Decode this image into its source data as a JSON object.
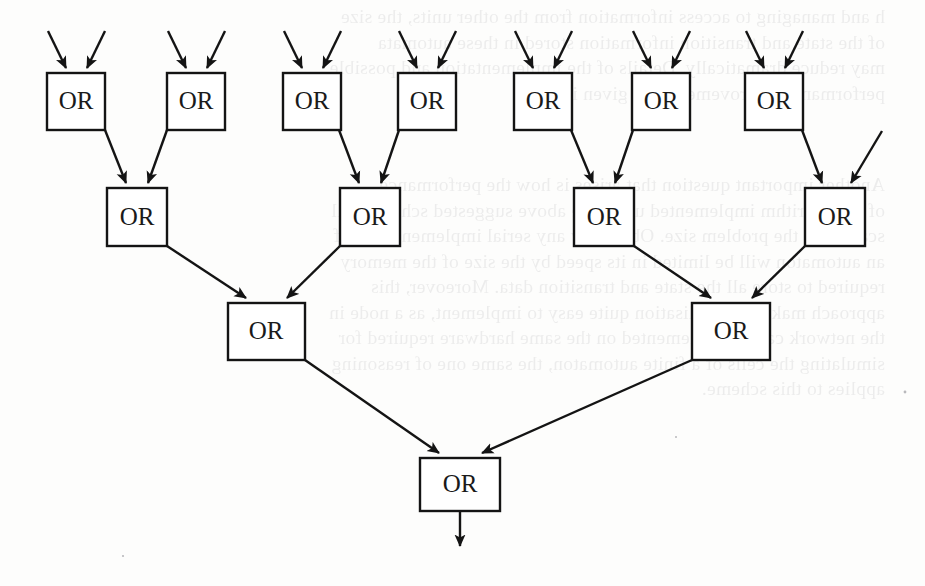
{
  "page": {
    "width": 925,
    "height": 586,
    "background_color": "#fdfdfc",
    "ink_color": "#141414",
    "kind": "scanned-book-figure"
  },
  "figure": {
    "gate_label": "OR",
    "levels": 4,
    "total_gates": 14,
    "output_arrow": true
  },
  "gates": {
    "row1": [
      {
        "id": "or-1-1",
        "label": "OR",
        "x": 47,
        "y": 73,
        "w": 58,
        "h": 57,
        "inputs": 2
      },
      {
        "id": "or-1-2",
        "label": "OR",
        "x": 167,
        "y": 73,
        "w": 58,
        "h": 57,
        "inputs": 2
      },
      {
        "id": "or-1-3",
        "label": "OR",
        "x": 283,
        "y": 73,
        "w": 58,
        "h": 57,
        "inputs": 2
      },
      {
        "id": "or-1-4",
        "label": "OR",
        "x": 398,
        "y": 73,
        "w": 58,
        "h": 57,
        "inputs": 2
      },
      {
        "id": "or-1-5",
        "label": "OR",
        "x": 514,
        "y": 73,
        "w": 58,
        "h": 57,
        "inputs": 2
      },
      {
        "id": "or-1-6",
        "label": "OR",
        "x": 632,
        "y": 73,
        "w": 58,
        "h": 57,
        "inputs": 2
      },
      {
        "id": "or-1-7",
        "label": "OR",
        "x": 745,
        "y": 73,
        "w": 58,
        "h": 57,
        "inputs": 2
      }
    ],
    "row2": [
      {
        "id": "or-2-1",
        "label": "OR",
        "x": 107,
        "y": 188,
        "w": 60,
        "h": 58,
        "inputs": 2
      },
      {
        "id": "or-2-2",
        "label": "OR",
        "x": 340,
        "y": 188,
        "w": 60,
        "h": 58,
        "inputs": 2
      },
      {
        "id": "or-2-3",
        "label": "OR",
        "x": 574,
        "y": 188,
        "w": 60,
        "h": 58,
        "inputs": 2
      },
      {
        "id": "or-2-4",
        "label": "OR",
        "x": 805,
        "y": 188,
        "w": 60,
        "h": 58,
        "inputs": 2
      }
    ],
    "row3": [
      {
        "id": "or-3-1",
        "label": "OR",
        "x": 228,
        "y": 303,
        "w": 77,
        "h": 57,
        "inputs": 2
      },
      {
        "id": "or-3-2",
        "label": "OR",
        "x": 692,
        "y": 303,
        "w": 78,
        "h": 57,
        "inputs": 2
      }
    ],
    "row4": [
      {
        "id": "or-4-1",
        "label": "OR",
        "x": 420,
        "y": 458,
        "w": 80,
        "h": 53,
        "inputs": 2
      }
    ]
  },
  "ghost_text": {
    "note": "Faint mirrored show-through text from the opposite side of the scanned page.",
    "blocks": [
      {
        "x": 40,
        "y": 4,
        "width": 860,
        "lines": "h and managing to access information from the other units, the size\nof the state and transition information stored in these automata\nmay reduce dramatically. Details of the implementation and possible\nperformance improvements are given in [?]."
      },
      {
        "x": 40,
        "y": 172,
        "width": 860,
        "lines": "Another important question that arises is how the performance\nof an algorithm implemented using the above suggested scheme will\nscale with the problem size. Obviously any serial implementation of\nan automaton will be limited in its speed by the size of the memory\nrequired to store all the state and transition data. Moreover, this\napproach makes parallelisation quite easy to implement, as a node in\nthe network can be implemented on the same hardware required for\nsimulating the cells of a finite automaton, the same one of reasoning\napplies to this scheme."
      }
    ]
  }
}
